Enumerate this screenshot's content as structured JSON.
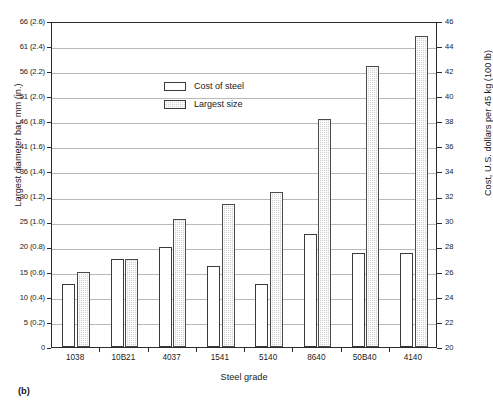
{
  "figure": {
    "panel_caption": "(b)"
  },
  "legend": {
    "position": "inside-upper-left",
    "entries": [
      {
        "label": "Cost of steel",
        "swatch": "open-white-rectangle"
      },
      {
        "label": "Largest size",
        "swatch": "gray-hatched-rectangle"
      }
    ]
  },
  "chart_data": {
    "type": "bar",
    "title": "",
    "subtitle": "",
    "xlabel": "Steel grade",
    "ylabel": "Largest diameter bar, mm (in.)",
    "ylabel_right": "Cost, U.S. dollars per 45 kg (100 lb)",
    "grid": true,
    "categories": [
      "1038",
      "10B21",
      "4037",
      "1541",
      "5140",
      "8640",
      "50B40",
      "4140"
    ],
    "ylim": [
      0,
      66
    ],
    "ylim_right": [
      20,
      46
    ],
    "yticks": [
      "0",
      "5 (0.2)",
      "10 (0.4)",
      "15 (0.6)",
      "20 (0.8)",
      "25 (1.0)",
      "30 (1.2)",
      "36 (1.4)",
      "41 (1.6)",
      "46 (1.8)",
      "51 (2.0)",
      "56 (2.2)",
      "61 (2.4)",
      "66 (2.6)"
    ],
    "ytick_values": [
      0,
      5,
      10,
      15,
      20,
      25,
      30,
      36,
      41,
      46,
      51,
      56,
      61,
      66
    ],
    "yticks_right": [
      "20",
      "22",
      "24",
      "26",
      "28",
      "30",
      "32",
      "34",
      "36",
      "38",
      "40",
      "42",
      "44",
      "46"
    ],
    "ytick_values_right": [
      20,
      22,
      24,
      26,
      28,
      30,
      32,
      34,
      36,
      38,
      40,
      42,
      44,
      46
    ],
    "series": [
      {
        "name": "Cost of steel",
        "axis": "right",
        "unit": "U.S. dollars per 45 kg (100 lb)",
        "values": [
          25.0,
          27.0,
          28.0,
          26.5,
          25.0,
          29.0,
          27.5,
          27.5
        ]
      },
      {
        "name": "Largest size",
        "axis": "left",
        "unit": "mm",
        "values": [
          15.0,
          17.5,
          25.5,
          28.5,
          31.0,
          46.5,
          57.0,
          63.0
        ]
      }
    ]
  }
}
